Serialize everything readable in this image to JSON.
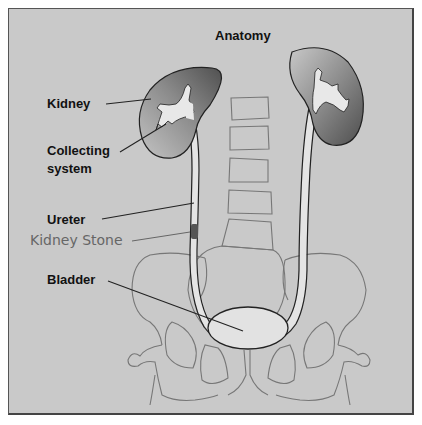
{
  "title": "Anatomy",
  "labels": {
    "kidney": "Kidney",
    "collecting_line1": "Collecting",
    "collecting_line2": "system",
    "ureter": "Ureter",
    "kidney_stone": "Kidney Stone",
    "bladder": "Bladder"
  },
  "colors": {
    "background": "#c9c9c9",
    "kidney_dark": "#5a5a5a",
    "kidney_light": "#b0b0b0",
    "collecting_system": "#e6e6e6",
    "bladder": "#e2e2e2",
    "stone": "#555555",
    "bone_lines": "#777777"
  }
}
